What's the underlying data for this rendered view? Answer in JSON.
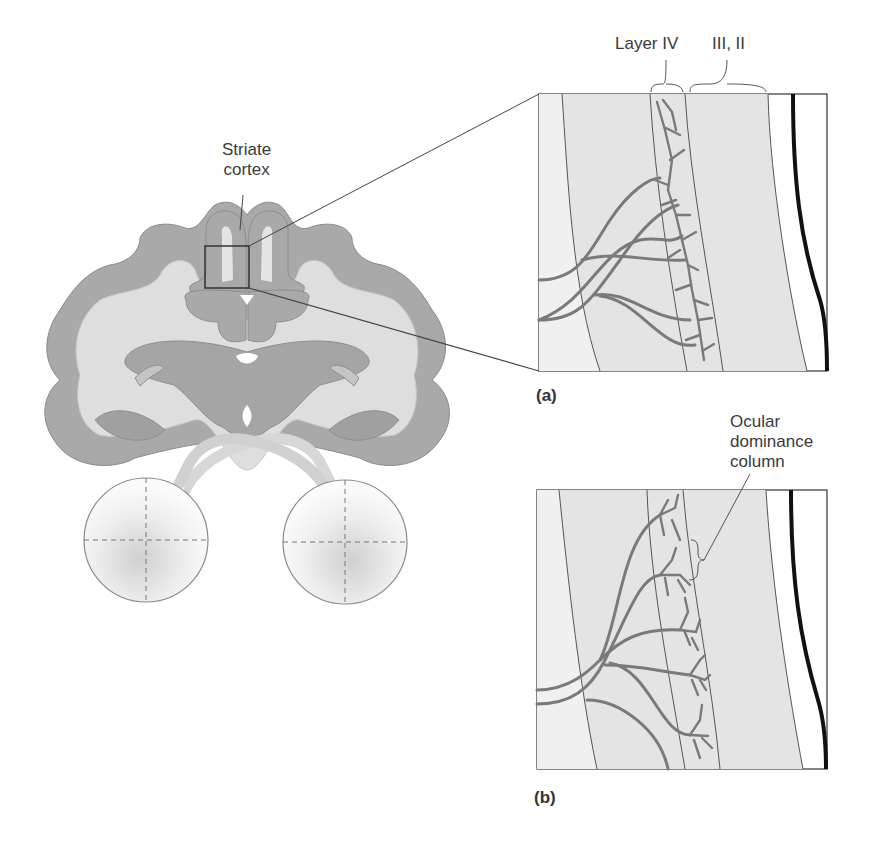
{
  "figure": {
    "brain_label": "Striate\ncortex",
    "brain_label_line1": "Striate",
    "brain_label_line2": "cortex",
    "layer_labels": {
      "layer4": "Layer IV",
      "layer32": "III, II"
    },
    "panel_a_tag": "(a)",
    "panel_b_tag": "(b)",
    "ocular_label_line1": "Ocular",
    "ocular_label_line2": "dominance",
    "ocular_label_line3": "column"
  },
  "colors": {
    "gray_matter": "#a8a8a8",
    "white_matter": "#dcdcdc",
    "panel_fill": "#e4e4e4",
    "axon": "#7a7a7a",
    "outline": "#555555",
    "pia": "#111111"
  }
}
